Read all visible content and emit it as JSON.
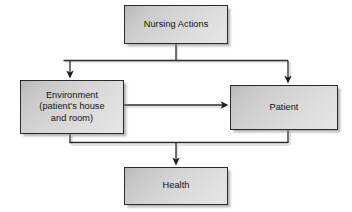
{
  "diagram": {
    "colors": {
      "node_border": "#2b2b2b",
      "node_fill_light": "#e6e6e6",
      "node_fill_dark": "#b9b9b9",
      "edge_stroke": "#2b2b2b",
      "background": "#ffffff"
    },
    "nodes": [
      {
        "id": "nursing-actions",
        "label": "Nursing Actions"
      },
      {
        "id": "environment",
        "label": "Environment\n(patient's house\nand room)"
      },
      {
        "id": "patient",
        "label": "Patient"
      },
      {
        "id": "health",
        "label": "Health"
      }
    ],
    "edges": [
      {
        "from": "nursing-actions",
        "to": "environment",
        "arrow": true
      },
      {
        "from": "nursing-actions",
        "to": "patient",
        "arrow": true
      },
      {
        "from": "environment",
        "to": "patient",
        "arrow": true
      },
      {
        "from": "environment",
        "to": "health",
        "arrow": true
      },
      {
        "from": "patient",
        "to": "health",
        "arrow": true
      }
    ]
  }
}
